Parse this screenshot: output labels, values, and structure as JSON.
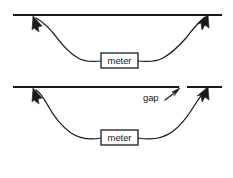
{
  "figure": {
    "background_color": "#ffffff",
    "ink_color": "#1a1a1a",
    "width": 233,
    "height": 178
  },
  "panels": [
    {
      "id": "top-panel",
      "name": "continuous-line-panel",
      "conductor": {
        "name": "horizontal-conductor-continuous",
        "has_gap": false,
        "y": 15,
        "x_start": 13,
        "x_end": 222,
        "segments": [
          {
            "x1": 13,
            "x2": 222
          }
        ]
      },
      "meter": {
        "label": "meter",
        "x": 101,
        "y": 53,
        "width": 37,
        "height": 15
      },
      "leads": [
        {
          "name": "left-lead",
          "arrow_tip_x": 33,
          "arrow_tip_y": 17,
          "arrow_direction": "up-left",
          "path": "M 101 61 C 84 63, 70 58, 58 44 C 48 33, 40 24, 34 18"
        },
        {
          "name": "right-lead",
          "arrow_tip_x": 207,
          "arrow_tip_y": 16,
          "arrow_direction": "up-right",
          "path": "M 138 61 C 155 63, 172 57, 185 42 C 194 31, 202 22, 206 17"
        }
      ],
      "annotations": []
    },
    {
      "id": "bottom-panel",
      "name": "gapped-line-panel",
      "conductor": {
        "name": "horizontal-conductor-gapped",
        "has_gap": true,
        "y": 87,
        "x_start": 13,
        "x_end": 222,
        "gap_start": 179,
        "gap_end": 187,
        "segments": [
          {
            "x1": 13,
            "x2": 179
          },
          {
            "x1": 187,
            "x2": 222
          }
        ]
      },
      "meter": {
        "label": "meter",
        "x": 101,
        "y": 130,
        "width": 37,
        "height": 15
      },
      "leads": [
        {
          "name": "left-lead",
          "arrow_tip_x": 33,
          "arrow_tip_y": 89,
          "arrow_direction": "up-left",
          "path": "M 101 138 C 82 140, 66 130, 54 112 C 46 100, 39 93, 34 90"
        },
        {
          "name": "right-lead",
          "arrow_tip_x": 207,
          "arrow_tip_y": 88,
          "arrow_direction": "up-right",
          "path": "M 138 138 C 158 140, 176 131, 190 113 C 198 102, 204 94, 206 89"
        }
      ],
      "annotations": [
        {
          "name": "gap-callout",
          "label": "gap",
          "label_x": 143,
          "label_y": 98,
          "pointer_path": "M 165 99 L 178 90",
          "pointer_tip_x": 179,
          "pointer_tip_y": 89,
          "pointer_direction": "up-right"
        }
      ]
    }
  ]
}
